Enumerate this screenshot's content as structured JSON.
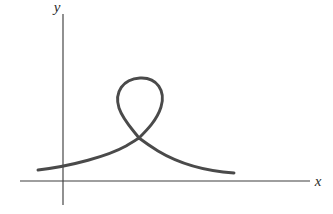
{
  "figure": {
    "background_color": "#ffffff",
    "width": 333,
    "height": 214,
    "axis_color": "#3f3f3f",
    "curve_color": "#4a4a4a"
  },
  "axes": {
    "x_axis": {
      "label": "x",
      "y_position": 181,
      "x_start": 20,
      "x_end": 310,
      "label_x": 318,
      "label_y": 186
    },
    "y_axis": {
      "label": "y",
      "x_position": 63,
      "y_start": 14,
      "y_end": 205,
      "label_x": 57,
      "label_y": 12
    },
    "origin": {
      "x": 63,
      "y": 181
    }
  },
  "chart_data": {
    "type": "line",
    "title": "",
    "subtitle": "",
    "xlabel": "x",
    "ylabel": "y",
    "grid": false,
    "legend": null,
    "annotations": [],
    "curves": [
      {
        "name": "nodal-loop-curve",
        "description": "Single continuous parametric curve with one self-intersection node; a tall loop rises above the node and two tails descend to the left and right toward the x-axis.",
        "color": "#4a4a4a",
        "stroke_width": 2.9,
        "closed": false,
        "self_intersection_node": {
          "x": 139,
          "y": 138
        },
        "loop_apex": {
          "x": 140,
          "y": 78
        },
        "loop_extent_x": [
          118,
          162
        ],
        "left_tail_endpoint": {
          "x": 38,
          "y": 170
        },
        "right_tail_endpoint": {
          "x": 234,
          "y": 173
        },
        "path": "M 38 170 C 72 166, 108 156, 126 146 C 132 142, 136 140, 139 138 C 133 130, 123 120, 119 108 C 114 92, 123 79, 140 78 C 157 77, 166 91, 161 107 C 157 120, 147 130, 139 138 C 143 141, 150 146, 158 151 C 178 163, 205 171, 234 173"
      }
    ],
    "points": {
      "left_tail_start": [
        38,
        170
      ],
      "node": [
        139,
        138
      ],
      "apex": [
        140,
        78
      ],
      "right_tail_end": [
        234,
        173
      ]
    },
    "xlim": [
      20,
      310
    ],
    "ylim": [
      14,
      205
    ]
  }
}
